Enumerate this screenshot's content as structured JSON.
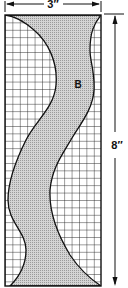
{
  "diagram": {
    "type": "pattern-template",
    "board": {
      "width_label": "3″",
      "height_label": "8″",
      "grid": "square grid"
    },
    "piece": {
      "label": "B",
      "fill": "#c8c8c8"
    },
    "colors": {
      "line": "#111111",
      "grid": "#222222",
      "shade": "#c8c8c8",
      "background": "#ffffff"
    }
  }
}
